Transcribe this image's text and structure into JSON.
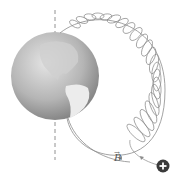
{
  "diagram": {
    "labels": {
      "field": "B",
      "field_vector_mark": "→",
      "charge": "+"
    },
    "colors": {
      "earth_light": "#d8d8d8",
      "earth_dark": "#8a8a8a",
      "land": "#e6e6e6",
      "line": "#8c8c8c",
      "charge_fill": "#3a3a3a",
      "charge_sign": "#ffffff"
    },
    "elements": [
      "earth-globe",
      "rotation-axis-dashed",
      "magnetic-field-line",
      "helical-particle-path",
      "positive-charge"
    ]
  }
}
